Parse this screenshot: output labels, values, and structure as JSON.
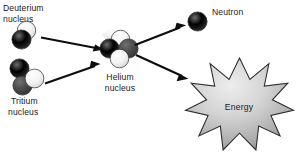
{
  "diagram": {
    "background_color": "#ffffff",
    "width": 297,
    "height": 157,
    "labels": {
      "deuterium_line1": "Deuterium",
      "deuterium_line2": "nucleus",
      "tritium_line1": "Tritium",
      "tritium_line2": "nucleus",
      "helium_line1": "Helium",
      "helium_line2": "nucleus",
      "neutron": "Neutron",
      "energy": "Energy"
    },
    "colors": {
      "proton_light": "#f2f2f2",
      "neutron_dark": "#3f3f3f",
      "sphere_stroke": "#2b2b2b",
      "arrow": "#0d0d0d",
      "text": "#1a1a1a",
      "burst_fill_light": "#e6e6e6",
      "burst_fill_dark": "#8f8f8f",
      "burst_stroke": "#2e2e2e"
    },
    "particles": {
      "deuterium": {
        "name": "Deuterium nucleus",
        "count": 2,
        "composition": "1 proton (light), 1 neutron (dark)"
      },
      "tritium": {
        "name": "Tritium nucleus",
        "count": 3,
        "composition": "1 proton (light), 2 neutrons (dark)"
      },
      "helium": {
        "name": "Helium nucleus",
        "count": 4,
        "composition": "2 protons (light), 2 neutrons (dark)"
      },
      "neutron": {
        "name": "Neutron",
        "count": 1,
        "composition": "1 neutron (dark)"
      }
    },
    "energy_burst": {
      "points": 12,
      "label": "Energy"
    },
    "arrows": [
      {
        "name": "deuterium-to-helium",
        "from": "Deuterium nucleus",
        "to": "Helium nucleus"
      },
      {
        "name": "tritium-to-helium",
        "from": "Tritium nucleus",
        "to": "Helium nucleus"
      },
      {
        "name": "helium-to-neutron",
        "from": "Helium nucleus",
        "to": "Neutron"
      },
      {
        "name": "helium-to-energy",
        "from": "Helium nucleus",
        "to": "Energy"
      }
    ]
  }
}
